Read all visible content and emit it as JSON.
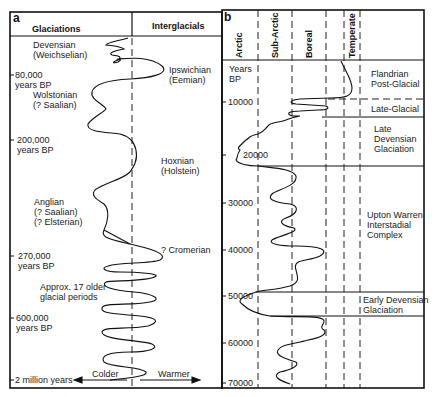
{
  "panel_a": {
    "letter": "a",
    "headers": {
      "left": "Glaciations",
      "right": "Interglacials"
    },
    "glaciation_labels": [
      {
        "line1": "Devensian",
        "line2": "(Weichselian)"
      },
      {
        "line1": "Wolstonian",
        "line2": "(? Saalian)"
      },
      {
        "line1": "Anglian",
        "line2": "(? Saalian)",
        "line3": "(? Elsterian)"
      },
      {
        "line1": "Approx. 17 older",
        "line2": "glacial periods"
      }
    ],
    "interglacial_labels": [
      {
        "line1": "Ipswichian",
        "line2": "(Eemian)"
      },
      {
        "line1": "Hoxnian",
        "line2": "(Holstein)"
      },
      {
        "line1": "? Cromerian"
      }
    ],
    "time_ticks": [
      {
        "line1": "80,000",
        "line2": "years BP"
      },
      {
        "line1": "200,000",
        "line2": "years BP"
      },
      {
        "line1": "270,000",
        "line2": "years BP"
      },
      {
        "line1": "600,000",
        "line2": "years BP"
      },
      {
        "line1": "2 million years"
      }
    ],
    "axis_arrows": {
      "left": "Colder",
      "right": "Warmer"
    }
  },
  "panel_b": {
    "letter": "b",
    "column_headers": [
      "Arctic",
      "Sub-Arctic",
      "Boreal",
      "Temperate"
    ],
    "axis_title": {
      "line1": "Years",
      "line2": "BP"
    },
    "time_ticks": [
      "10000",
      "20000",
      "30000",
      "40000",
      "50000",
      "60000",
      "70000"
    ],
    "periods": [
      {
        "line1": "Flandrian",
        "line2": "Post-Glacial"
      },
      {
        "line1": "Late-Glacial"
      },
      {
        "line1": "Late",
        "line2": "Devensian",
        "line3": "Glaciation"
      },
      {
        "line1": "Upton Warren",
        "line2": "Interstadial",
        "line3": "Complex"
      },
      {
        "line1": "Early Devensian",
        "line2": "Glaciation"
      }
    ]
  }
}
